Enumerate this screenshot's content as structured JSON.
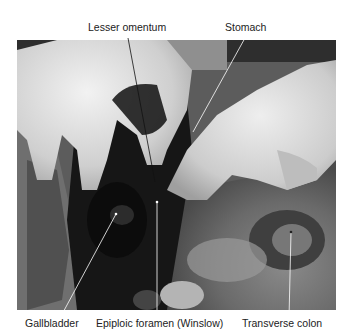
{
  "figure": {
    "colors": {
      "background": "#ffffff",
      "label_text": "#222222",
      "leader_line": "#ffffff"
    }
  },
  "labels": {
    "top": [
      {
        "text": "Lesser omentum"
      },
      {
        "text": "Stomach"
      }
    ],
    "bottom": [
      {
        "text": "Gallbladder"
      },
      {
        "text": "Epiploic foramen (Winslow)"
      },
      {
        "text": "Transverse colon"
      }
    ]
  }
}
